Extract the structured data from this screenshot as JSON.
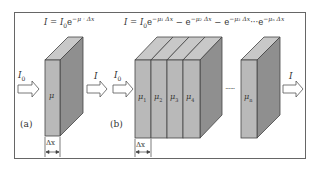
{
  "diagram": {
    "title_a": "I = I₀e⁻ᵘ·Δx",
    "equation_a": {
      "lhs": "I",
      "rhs_base": "I",
      "rhs_sub": "0",
      "exp": "e",
      "exp_power": "−μ · Δx"
    },
    "equation_b": {
      "text": "I = I₀e⁻ᵘ¹Δx − e⁻ᵘ²Δx − e⁻ᵘ³Δx ··· e⁻ᵘⁿΔx",
      "terms": [
        "−μ₁ Δx",
        "−μ₂ Δx",
        "−μ₃ Δx",
        "−μₙ Δx"
      ]
    },
    "panel_a": {
      "caption": "(a)",
      "input_label": "I",
      "input_sub": "0",
      "output_label": "I",
      "slab_label": "μ",
      "width_label": "Δx"
    },
    "panel_b": {
      "caption": "(b)",
      "input_label": "I",
      "input_sub": "0",
      "output_label": "I",
      "slabs": [
        {
          "label": "μ",
          "sub": "1"
        },
        {
          "label": "μ",
          "sub": "2"
        },
        {
          "label": "μ",
          "sub": "3"
        },
        {
          "label": "μ",
          "sub": "4"
        }
      ],
      "ellipsis": "······",
      "last_slab": {
        "label": "μ",
        "sub": "n"
      },
      "width_label": "Δx"
    },
    "colors": {
      "front": "#b9b9b9",
      "side": "#8f8f8f",
      "top": "#c8c8c8",
      "edge": "#444444",
      "frame": "#555555"
    }
  }
}
